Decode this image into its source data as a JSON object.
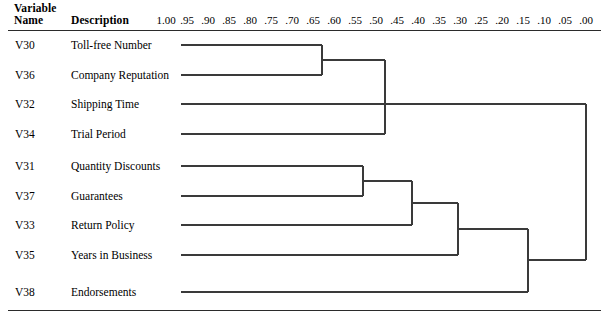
{
  "header": {
    "variable_word": "Variable",
    "name_word": "Name",
    "description_word": "Description"
  },
  "scale": {
    "labels": [
      "1.00",
      ".95",
      ".90",
      ".85",
      ".80",
      ".75",
      ".70",
      ".65",
      ".60",
      ".55",
      ".50",
      ".45",
      ".40",
      ".35",
      ".30",
      ".25",
      ".20",
      ".15",
      ".10",
      ".05",
      ".00"
    ],
    "values": [
      1.0,
      0.95,
      0.9,
      0.85,
      0.8,
      0.75,
      0.7,
      0.65,
      0.6,
      0.55,
      0.5,
      0.45,
      0.4,
      0.35,
      0.3,
      0.25,
      0.2,
      0.15,
      0.1,
      0.05,
      0.0
    ],
    "x_px": [
      166,
      187,
      208,
      229,
      250,
      271,
      292,
      313,
      334,
      355,
      376,
      397,
      418,
      439,
      460,
      481,
      502,
      523,
      544,
      565,
      586
    ]
  },
  "rows": [
    {
      "code": "V30",
      "description": "Toll-free Number",
      "y_px": 45
    },
    {
      "code": "V36",
      "description": "Company Reputation",
      "y_px": 75
    },
    {
      "code": "V32",
      "description": "Shipping Time",
      "y_px": 104
    },
    {
      "code": "V34",
      "description": "Trial Period",
      "y_px": 134
    },
    {
      "code": "V31",
      "description": "Quantity Discounts",
      "y_px": 166
    },
    {
      "code": "V37",
      "description": "Guarantees",
      "y_px": 196
    },
    {
      "code": "V33",
      "description": "Return Policy",
      "y_px": 225
    },
    {
      "code": "V35",
      "description": "Years in Business",
      "y_px": 255
    },
    {
      "code": "V38",
      "description": "Endorsements",
      "y_px": 292
    }
  ],
  "chart_data": {
    "type": "dendrogram",
    "title": "",
    "xlabel": "Rescaled Distance Cluster Combine",
    "ylabel": "",
    "axis_direction": "right-to-left",
    "xlim": [
      1.0,
      0.0
    ],
    "grid": false,
    "leaf_start_px": 181,
    "leaves": [
      {
        "code": "V30",
        "description": "Toll-free Number",
        "y_px": 45
      },
      {
        "code": "V36",
        "description": "Company Reputation",
        "y_px": 75
      },
      {
        "code": "V32",
        "description": "Shipping Time",
        "y_px": 104
      },
      {
        "code": "V34",
        "description": "Trial Period",
        "y_px": 134
      },
      {
        "code": "V31",
        "description": "Quantity Discounts",
        "y_px": 166
      },
      {
        "code": "V37",
        "description": "Guarantees",
        "y_px": 196
      },
      {
        "code": "V33",
        "description": "Return Policy",
        "y_px": 225
      },
      {
        "code": "V35",
        "description": "Years in Business",
        "y_px": 255
      },
      {
        "code": "V38",
        "description": "Endorsements",
        "y_px": 292
      }
    ],
    "merges": [
      {
        "id": "m1",
        "members": [
          "V30",
          "V36"
        ],
        "x_px": 322,
        "similarity": 0.63,
        "y_top_px": 45,
        "y_bot_px": 75
      },
      {
        "id": "m2",
        "members": [
          "V30",
          "V36",
          "V34"
        ],
        "x_px": 385,
        "similarity": 0.48,
        "y_top_px": 60,
        "y_bot_px": 134
      },
      {
        "id": "m3",
        "members": [
          "V31",
          "V37"
        ],
        "x_px": 363,
        "similarity": 0.53,
        "y_top_px": 166,
        "y_bot_px": 196
      },
      {
        "id": "m4",
        "members": [
          "V31",
          "V37",
          "V33"
        ],
        "x_px": 412,
        "similarity": 0.41,
        "y_top_px": 181,
        "y_bot_px": 225
      },
      {
        "id": "m5",
        "members": [
          "V31",
          "V37",
          "V33",
          "V35"
        ],
        "x_px": 458,
        "similarity": 0.3,
        "y_top_px": 203,
        "y_bot_px": 255
      },
      {
        "id": "m6",
        "members": [
          "V31",
          "V37",
          "V33",
          "V35",
          "V38"
        ],
        "x_px": 528,
        "similarity": 0.13,
        "y_top_px": 229,
        "y_bot_px": 292
      },
      {
        "id": "m7",
        "members": [
          "ALL"
        ],
        "x_px": 586,
        "similarity": 0.0,
        "y_top_px": 104,
        "y_bot_px": 260
      }
    ],
    "segments_h": [
      {
        "name": "leaf-V30",
        "x1": 181,
        "x2": 322,
        "y": 45
      },
      {
        "name": "leaf-V36",
        "x1": 181,
        "x2": 322,
        "y": 75
      },
      {
        "name": "leaf-V32",
        "x1": 181,
        "x2": 586,
        "y": 104
      },
      {
        "name": "leaf-V34",
        "x1": 181,
        "x2": 385,
        "y": 134
      },
      {
        "name": "leaf-V31",
        "x1": 181,
        "x2": 363,
        "y": 166
      },
      {
        "name": "leaf-V37",
        "x1": 181,
        "x2": 363,
        "y": 196
      },
      {
        "name": "leaf-V33",
        "x1": 181,
        "x2": 412,
        "y": 225
      },
      {
        "name": "leaf-V35",
        "x1": 181,
        "x2": 458,
        "y": 255
      },
      {
        "name": "leaf-V38",
        "x1": 181,
        "x2": 528,
        "y": 292
      },
      {
        "name": "merge-m1-stem",
        "x1": 322,
        "x2": 385,
        "y": 60
      },
      {
        "name": "merge-m2-stem",
        "x1": 385,
        "x2": 586,
        "y": 104
      },
      {
        "name": "merge-m3-stem",
        "x1": 363,
        "x2": 412,
        "y": 181
      },
      {
        "name": "merge-m4-stem",
        "x1": 412,
        "x2": 458,
        "y": 203
      },
      {
        "name": "merge-m5-stem",
        "x1": 458,
        "x2": 528,
        "y": 229
      },
      {
        "name": "merge-m6-stem",
        "x1": 528,
        "x2": 586,
        "y": 260
      }
    ],
    "segments_v": [
      {
        "name": "merge-m1-bar",
        "x": 322,
        "y1": 45,
        "y2": 75
      },
      {
        "name": "merge-m2-bar",
        "x": 385,
        "y1": 60,
        "y2": 134
      },
      {
        "name": "merge-m3-bar",
        "x": 363,
        "y1": 166,
        "y2": 196
      },
      {
        "name": "merge-m4-bar",
        "x": 412,
        "y1": 181,
        "y2": 225
      },
      {
        "name": "merge-m5-bar",
        "x": 458,
        "y1": 203,
        "y2": 255
      },
      {
        "name": "merge-m6-bar",
        "x": 528,
        "y1": 229,
        "y2": 292
      },
      {
        "name": "merge-m7-bar",
        "x": 586,
        "y1": 104,
        "y2": 260
      }
    ]
  },
  "colors": {
    "line": "#3a3a3a",
    "rule": "#2b2b2b",
    "text": "#000000",
    "background": "#ffffff"
  }
}
